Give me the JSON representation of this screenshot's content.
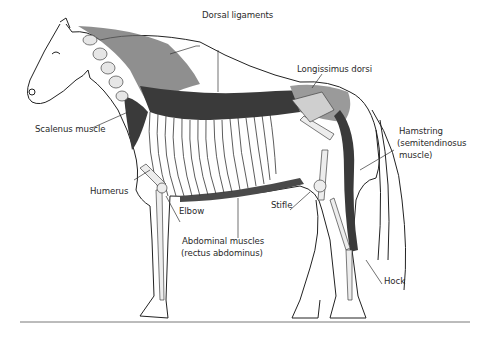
{
  "figure": {
    "labels": {
      "dorsal_ligaments": "Dorsal ligaments",
      "longissimus_dorsi": "Longissimus dorsi",
      "scalenus_muscle": "Scalenus muscle",
      "hamstring_line1": "Hamstring",
      "hamstring_line2": "(semitendinosus",
      "hamstring_line3": "muscle)",
      "humerus": "Humerus",
      "elbow": "Elbow",
      "stifle": "Stifle",
      "abdominal_line1": "Abdominal muscles",
      "abdominal_line2": "(rectus abdominus)",
      "hock": "Hock"
    },
    "colors": {
      "ink": "#2a2a2a",
      "muscle_dark": "#3a3a3a",
      "muscle_mid": "#8a8a8a",
      "bone_shade": "#d8d8d8",
      "background": "#ffffff"
    }
  }
}
